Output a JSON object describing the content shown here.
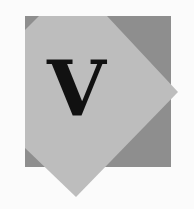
{
  "logo": {
    "letter": "V",
    "colors": {
      "background": "#fbfbfb",
      "square": "#8e8e8e",
      "diamond": "#bdbdbd",
      "letter": "#111111"
    }
  }
}
